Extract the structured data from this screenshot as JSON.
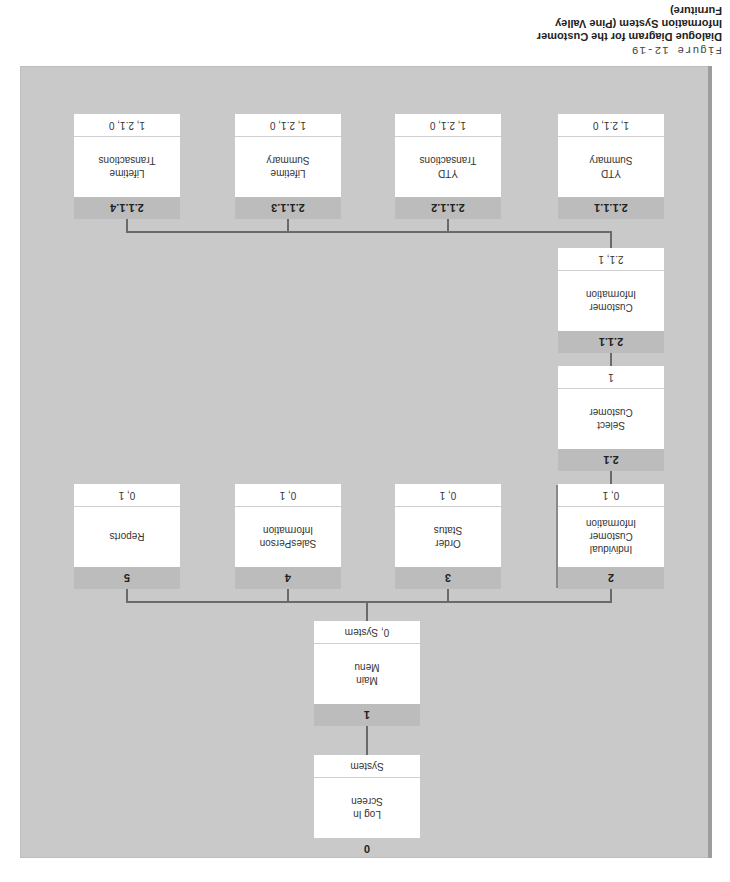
{
  "figure": {
    "label": "Figure 12-19",
    "title": "Dialogue Diagram for the Customer Information System (Pine Valley Furniture)"
  },
  "nodes": [
    {
      "id": "0",
      "number": "0",
      "label": "Log In\nScreen",
      "footer": "System"
    },
    {
      "id": "1",
      "number": "1",
      "label": "Main\nMenu",
      "footer": "0, System"
    },
    {
      "id": "2",
      "number": "2",
      "label": "Individual\nCustomer\nInformation",
      "footer": "0, 1"
    },
    {
      "id": "3",
      "number": "3",
      "label": "Order\nStatus",
      "footer": "0, 1"
    },
    {
      "id": "4",
      "number": "4",
      "label": "SalesPerson\nInformation",
      "footer": "0, 1"
    },
    {
      "id": "5",
      "number": "5",
      "label": "Reports",
      "footer": "0, 1"
    },
    {
      "id": "2.1",
      "number": "2.1",
      "label": "Select\nCustomer",
      "footer": "1"
    },
    {
      "id": "2.1.1",
      "number": "2.1.1",
      "label": "Customer\nInformation",
      "footer": "2.1, 1"
    },
    {
      "id": "2.1.1.1",
      "number": "2.1.1.1",
      "label": "YTD\nSummary",
      "footer": "1, 2.1, 0"
    },
    {
      "id": "2.1.1.2",
      "number": "2.1.1.2",
      "label": "YTD\nTransactions",
      "footer": "1, 2.1, 0"
    },
    {
      "id": "2.1.1.3",
      "number": "2.1.1.3",
      "label": "Lifetime\nSummary",
      "footer": "1, 2.1, 0"
    },
    {
      "id": "2.1.1.4",
      "number": "2.1.1.4",
      "label": "Lifetime\nTransactions",
      "footer": "1, 2.1, 0"
    }
  ],
  "edges": [
    [
      "0",
      "1"
    ],
    [
      "1",
      "2"
    ],
    [
      "1",
      "3"
    ],
    [
      "1",
      "4"
    ],
    [
      "1",
      "5"
    ],
    [
      "2",
      "2.1"
    ],
    [
      "2.1",
      "2.1.1"
    ],
    [
      "2.1.1",
      "2.1.1.1"
    ],
    [
      "2.1.1",
      "2.1.1.2"
    ],
    [
      "2.1.1",
      "2.1.1.3"
    ],
    [
      "2.1.1",
      "2.1.1.4"
    ]
  ],
  "orientation": "rotated 180 degrees"
}
